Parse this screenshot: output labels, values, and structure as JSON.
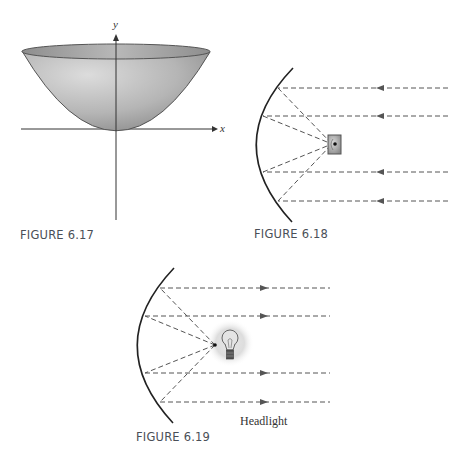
{
  "figures": [
    {
      "id": "fig617",
      "caption": "FIGURE 6.17",
      "description": "Paraboloid surface with axes",
      "axes": {
        "x_label": "x",
        "y_label": "y"
      }
    },
    {
      "id": "fig618",
      "caption": "FIGURE 6.18",
      "description": "Parabolic reflector focusing incoming parallel rays onto a receiver at the focus",
      "ray_direction": "incoming (right to left)",
      "ray_count": 4
    },
    {
      "id": "fig619",
      "caption": "FIGURE 6.19",
      "description": "Parabolic reflector with a light bulb at the focus sending out parallel rays",
      "ray_direction": "outgoing (left to right)",
      "ray_count": 4,
      "label": "Headlight"
    }
  ],
  "colors": {
    "line": "#222222",
    "ray": "#555555",
    "caption": "#4a4f57",
    "surface_light": "#d6d6d6",
    "surface_dark": "#8a8a8a"
  }
}
